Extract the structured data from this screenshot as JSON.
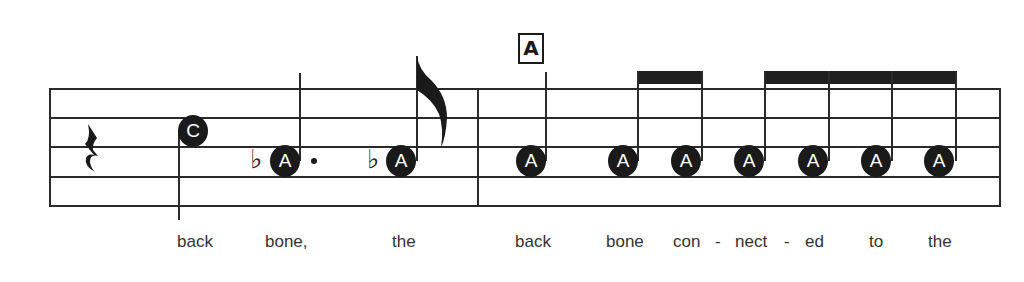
{
  "rehearsal_mark": "A",
  "measures": [
    {
      "notes": [
        {
          "type": "quarter-rest"
        },
        {
          "label": "C",
          "duration": "quarter"
        },
        {
          "label": "A",
          "accidental": "flat",
          "duration": "dotted-quarter"
        },
        {
          "label": "A",
          "accidental": "flat",
          "duration": "eighth"
        }
      ]
    },
    {
      "notes": [
        {
          "label": "A",
          "duration": "quarter"
        },
        {
          "label": "A",
          "duration": "eighth"
        },
        {
          "label": "A",
          "duration": "eighth"
        },
        {
          "label": "A",
          "duration": "eighth"
        },
        {
          "label": "A",
          "duration": "eighth"
        },
        {
          "label": "A",
          "duration": "eighth"
        },
        {
          "label": "A",
          "duration": "eighth"
        }
      ]
    }
  ],
  "note_labels": [
    "C",
    "A",
    "A",
    "A",
    "A",
    "A",
    "A",
    "A",
    "A",
    "A"
  ],
  "accidental_glyph": "♭",
  "lyrics": [
    "back",
    "bone,",
    "the",
    "back",
    "bone",
    "con",
    "-",
    "nect",
    "-",
    "ed",
    "to",
    "the"
  ]
}
